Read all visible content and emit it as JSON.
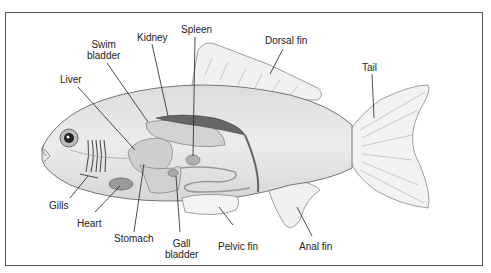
{
  "diagram": {
    "labels": [
      {
        "id": "spleen",
        "text": "Spleen"
      },
      {
        "id": "kidney",
        "text": "Kidney"
      },
      {
        "id": "swim_bladder",
        "text": "Swim bladder"
      },
      {
        "id": "liver",
        "text": "Liver"
      },
      {
        "id": "dorsal_fin",
        "text": "Dorsal fin"
      },
      {
        "id": "tail",
        "text": "Tail"
      },
      {
        "id": "gills",
        "text": "Gills"
      },
      {
        "id": "heart",
        "text": "Heart"
      },
      {
        "id": "stomach",
        "text": "Stomach"
      },
      {
        "id": "gall_bladder",
        "text": "Gall bladder"
      },
      {
        "id": "pelvic_fin",
        "text": "Pelvic fin"
      },
      {
        "id": "anal_fin",
        "text": "Anal fin"
      }
    ],
    "swim_label_line1": "Swim",
    "swim_label_line2": "bladder",
    "gall_label_line1": "Gall",
    "gall_label_line2": "bladder",
    "colors": {
      "body": "#e6e6e6",
      "fin": "#f2f2f2",
      "organ": "#c8c8c8",
      "kidney": "#6e6e6e",
      "outline": "#777777",
      "leader": "#222222"
    }
  }
}
